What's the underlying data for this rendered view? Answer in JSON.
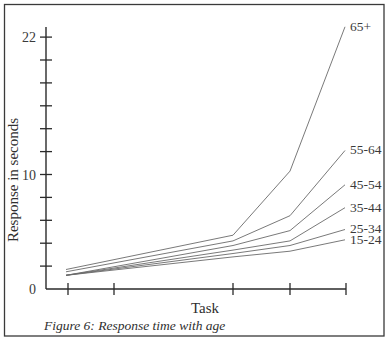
{
  "chart_data": {
    "type": "line",
    "title": "Figure 6: Response time with age",
    "xlabel": "Task",
    "ylabel": "Response in seconds",
    "x": [
      1,
      2,
      3,
      4,
      5
    ],
    "x_tick_labels": [
      "",
      "",
      "",
      "",
      ""
    ],
    "y_tick_labels": [
      "0",
      "10",
      "22"
    ],
    "y_minor_tick_step": 2,
    "ylim": [
      0,
      22
    ],
    "grid": false,
    "legend_position": "inline-right",
    "series": [
      {
        "name": "65+",
        "x": [
          1,
          3,
          4,
          5
        ],
        "values": [
          1.7,
          4.7,
          10.3,
          22.9
        ]
      },
      {
        "name": "55-64",
        "x": [
          1,
          3,
          4,
          5
        ],
        "values": [
          1.5,
          4.2,
          6.4,
          12.1
        ]
      },
      {
        "name": "45-54",
        "x": [
          1,
          3,
          4,
          5
        ],
        "values": [
          1.2,
          3.8,
          5.1,
          9.1
        ]
      },
      {
        "name": "35-44",
        "x": [
          1,
          3,
          4,
          5
        ],
        "values": [
          1.2,
          3.4,
          4.2,
          7.1
        ]
      },
      {
        "name": "25-34",
        "x": [
          1,
          3,
          4,
          5
        ],
        "values": [
          1.2,
          3.1,
          3.8,
          5.2
        ]
      },
      {
        "name": "15-24",
        "x": [
          1,
          3,
          4,
          5
        ],
        "values": [
          1.2,
          2.8,
          3.3,
          4.3
        ]
      }
    ]
  },
  "figure": {
    "caption": "Figure 6: Response time with age",
    "x_axis_title": "Task",
    "y_axis_title": "Response in seconds"
  },
  "colors": {
    "frame": "#3a3a3a",
    "axis": "#2a2a2a",
    "series_line": "#6a6a6a",
    "text": "#2f2f2f"
  }
}
